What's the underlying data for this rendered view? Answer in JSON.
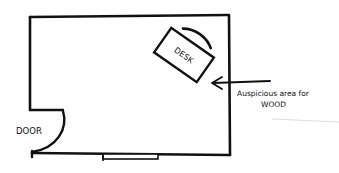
{
  "diagram": {
    "type": "floor-plan",
    "room": {
      "x": 30,
      "y": 15,
      "width": 200,
      "height": 140
    },
    "desk": {
      "label": "DESK",
      "cx": 184,
      "cy": 55,
      "width": 52,
      "height": 30,
      "rotation": 35
    },
    "door": {
      "label": "DOOR"
    },
    "window": {
      "x": 103,
      "y": 154,
      "width": 55,
      "height": 5
    },
    "annotation": {
      "line1": "Auspicious area for",
      "line2": "WOOD",
      "arrow": {
        "from": [
          270,
          81
        ],
        "to": [
          212,
          83
        ]
      }
    },
    "colors": {
      "stroke": "#111111",
      "background": "#ffffff"
    }
  }
}
